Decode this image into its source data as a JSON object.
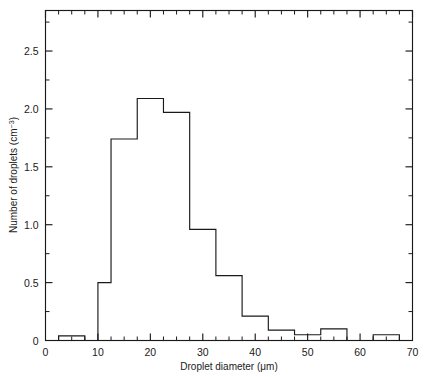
{
  "chart_data": {
    "type": "bar",
    "title": "",
    "xlabel": "Droplet diameter (μm)",
    "ylabel": "Number of droplets (cm⁻³)",
    "ylabel_base": "Number of droplets (cm",
    "ylabel_sup": "−3",
    "ylabel_tail": ")",
    "xlim": [
      0,
      70
    ],
    "ylim": [
      0,
      2.85
    ],
    "grid": false,
    "legend": null,
    "bin_edges": [
      2.5,
      5,
      7.5,
      10,
      12.5,
      17.5,
      22.5,
      27.5,
      32.5,
      37.5,
      42.5,
      47.5,
      52.5,
      57.5,
      62.5,
      67.5
    ],
    "categories": [
      "2.5–5",
      "5–7.5",
      "7.5–10",
      "10–12.5",
      "12.5–17.5",
      "17.5–22.5",
      "22.5–27.5",
      "27.5–32.5",
      "32.5–37.5",
      "37.5–42.5",
      "42.5–47.5",
      "47.5–52.5",
      "52.5–57.5",
      "57.5–62.5",
      "62.5–67.5"
    ],
    "values": [
      0.04,
      0.04,
      0.0,
      0.5,
      1.74,
      2.09,
      1.97,
      0.96,
      0.56,
      0.21,
      0.09,
      0.05,
      0.1,
      0.0,
      0.05
    ],
    "bars": [
      {
        "x0": 2.5,
        "x1": 5,
        "y": 0.04
      },
      {
        "x0": 5,
        "x1": 7.5,
        "y": 0.04
      },
      {
        "x0": 10,
        "x1": 12.5,
        "y": 0.5
      },
      {
        "x0": 12.5,
        "x1": 17.5,
        "y": 1.74
      },
      {
        "x0": 17.5,
        "x1": 22.5,
        "y": 2.09
      },
      {
        "x0": 22.5,
        "x1": 27.5,
        "y": 1.97
      },
      {
        "x0": 27.5,
        "x1": 32.5,
        "y": 0.96
      },
      {
        "x0": 32.5,
        "x1": 37.5,
        "y": 0.56
      },
      {
        "x0": 37.5,
        "x1": 42.5,
        "y": 0.21
      },
      {
        "x0": 42.5,
        "x1": 47.5,
        "y": 0.09
      },
      {
        "x0": 47.5,
        "x1": 52.5,
        "y": 0.05
      },
      {
        "x0": 52.5,
        "x1": 57.5,
        "y": 0.1
      },
      {
        "x0": 62.5,
        "x1": 67.5,
        "y": 0.05
      }
    ],
    "x_ticks_major": [
      0,
      10,
      20,
      30,
      40,
      50,
      60,
      70
    ],
    "x_tick_labels": [
      "0",
      "10",
      "20",
      "30",
      "40",
      "50",
      "60",
      "70"
    ],
    "x_ticks_minor": [
      2.5,
      5,
      7.5,
      12.5,
      15,
      17.5,
      22.5,
      25,
      27.5,
      32.5,
      35,
      37.5,
      42.5,
      45,
      47.5,
      52.5,
      55,
      57.5,
      62.5,
      65,
      67.5
    ],
    "y_ticks_major": [
      0,
      0.5,
      1.0,
      1.5,
      2.0,
      2.5
    ],
    "y_tick_labels": [
      "0",
      "0.5",
      "1.0",
      "1.5",
      "2.0",
      "2.5"
    ],
    "y_ticks_minor": [
      0.25,
      0.75,
      1.25,
      1.75,
      2.25,
      2.75
    ]
  },
  "style": {
    "line_color": "#1a1a1a",
    "background": "#ffffff"
  }
}
